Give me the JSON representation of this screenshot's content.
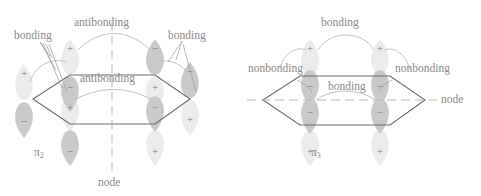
{
  "figure": {
    "type": "chemistry-molecular-orbital-diagram",
    "stroke_color": "#6b6b6b",
    "text_color": "#8a8a8a",
    "lobe_light_fill": "#ececec",
    "lobe_dark_fill": "#c9c9c9",
    "arc_color": "#bdbdbd"
  },
  "panels": [
    {
      "id": "pi2",
      "orbital_label": "π",
      "orbital_subscript": "2",
      "node_label": "node",
      "node_orientation": "vertical",
      "labels": [
        {
          "name": "antibonding-top",
          "text": "antibonding"
        },
        {
          "name": "bonding-left",
          "text": "bonding"
        },
        {
          "name": "bonding-right",
          "text": "bonding"
        },
        {
          "name": "antibonding-inner",
          "text": "antibonding"
        }
      ],
      "lobes": [
        {
          "pos": "top-left-upper",
          "sign": "+",
          "shade": "light"
        },
        {
          "pos": "top-right-upper",
          "sign": "−",
          "shade": "dark"
        },
        {
          "pos": "left-vertex-upper",
          "sign": "+",
          "shade": "light"
        },
        {
          "pos": "left-vertex-lower",
          "sign": "−",
          "shade": "dark"
        },
        {
          "pos": "right-vertex-upper",
          "sign": "−",
          "shade": "dark"
        },
        {
          "pos": "right-vertex-lower",
          "sign": "+",
          "shade": "light"
        },
        {
          "pos": "top-left-inner",
          "sign": "−",
          "shade": "dark"
        },
        {
          "pos": "top-right-inner",
          "sign": "+",
          "shade": "light"
        },
        {
          "pos": "bottom-left-inner",
          "sign": "+",
          "shade": "light"
        },
        {
          "pos": "bottom-right-inner",
          "sign": "−",
          "shade": "dark"
        },
        {
          "pos": "bottom-left-lower",
          "sign": "−",
          "shade": "dark"
        },
        {
          "pos": "bottom-right-lower",
          "sign": "+",
          "shade": "light"
        }
      ]
    },
    {
      "id": "pi3",
      "orbital_label": "π",
      "orbital_subscript": "3",
      "node_label": "node",
      "node_orientation": "horizontal",
      "labels": [
        {
          "name": "bonding-top",
          "text": "bonding"
        },
        {
          "name": "nonbonding-left",
          "text": "nonbonding"
        },
        {
          "name": "nonbonding-right",
          "text": "nonbonding"
        },
        {
          "name": "bonding-inner",
          "text": "bonding"
        }
      ],
      "lobes": [
        {
          "pos": "top-left-upper",
          "sign": "+",
          "shade": "light"
        },
        {
          "pos": "top-right-upper",
          "sign": "+",
          "shade": "light"
        },
        {
          "pos": "top-left-inner",
          "sign": "−",
          "shade": "dark"
        },
        {
          "pos": "top-right-inner",
          "sign": "−",
          "shade": "dark"
        },
        {
          "pos": "bottom-left-inner",
          "sign": "−",
          "shade": "dark"
        },
        {
          "pos": "bottom-right-inner",
          "sign": "−",
          "shade": "dark"
        },
        {
          "pos": "bottom-left-lower",
          "sign": "+",
          "shade": "light"
        },
        {
          "pos": "bottom-right-lower",
          "sign": "+",
          "shade": "light"
        }
      ]
    }
  ]
}
